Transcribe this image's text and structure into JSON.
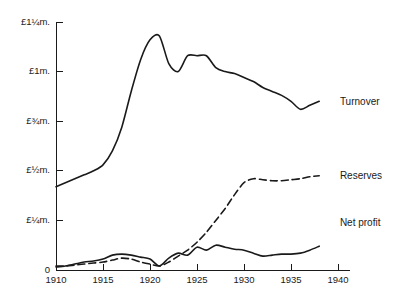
{
  "chart_data": {
    "type": "line",
    "title": "",
    "subtitle": "",
    "xlabel": "",
    "ylabel": "",
    "xlim": [
      1910,
      1940
    ],
    "ylim": [
      0,
      1.25
    ],
    "grid": false,
    "legend_position": "inline-right",
    "y_tick_values": [
      0,
      0.25,
      0.5,
      0.75,
      1.0,
      1.25
    ],
    "y_tick_labels": [
      "0",
      "£¼m.",
      "£½m.",
      "£¾m.",
      "£1m.",
      "£1¼m."
    ],
    "x_tick_values": [
      1910,
      1915,
      1920,
      1925,
      1930,
      1935,
      1940
    ],
    "x_tick_labels": [
      "1910",
      "1915",
      "1920",
      "1925",
      "1930",
      "1935",
      "1940"
    ],
    "units": "pounds sterling (millions)",
    "series": [
      {
        "name": "Turnover",
        "label": "Turnover",
        "style": "solid",
        "color": "#1a1a1a",
        "label_x": 1940.2,
        "label_y": 0.845,
        "x": [
          1910,
          1911,
          1912,
          1913,
          1914,
          1915,
          1916,
          1917,
          1918,
          1919,
          1920,
          1921,
          1922,
          1923,
          1924,
          1925,
          1926,
          1927,
          1928,
          1929,
          1930,
          1931,
          1932,
          1933,
          1934,
          1935,
          1936,
          1937,
          1938
        ],
        "y": [
          0.42,
          0.44,
          0.46,
          0.48,
          0.5,
          0.53,
          0.6,
          0.72,
          0.9,
          1.06,
          1.16,
          1.18,
          1.04,
          1.0,
          1.08,
          1.08,
          1.08,
          1.02,
          1.0,
          0.99,
          0.97,
          0.95,
          0.92,
          0.9,
          0.88,
          0.85,
          0.81,
          0.83,
          0.85
        ]
      },
      {
        "name": "Reserves",
        "label": "Reserves",
        "style": "dashed",
        "color": "#1a1a1a",
        "label_x": 1940.2,
        "label_y": 0.47,
        "x": [
          1910,
          1911,
          1912,
          1913,
          1914,
          1915,
          1916,
          1917,
          1918,
          1919,
          1920,
          1921,
          1922,
          1923,
          1924,
          1925,
          1926,
          1927,
          1928,
          1929,
          1930,
          1931,
          1932,
          1933,
          1934,
          1935,
          1936,
          1937,
          1938
        ],
        "y": [
          0.02,
          0.02,
          0.025,
          0.03,
          0.035,
          0.04,
          0.05,
          0.06,
          0.055,
          0.04,
          0.03,
          0.02,
          0.04,
          0.07,
          0.1,
          0.14,
          0.19,
          0.25,
          0.31,
          0.38,
          0.44,
          0.46,
          0.455,
          0.45,
          0.45,
          0.455,
          0.46,
          0.47,
          0.475
        ]
      },
      {
        "name": "Net profit",
        "label": "Net profit",
        "style": "solid",
        "color": "#1a1a1a",
        "label_x": 1940.2,
        "label_y": 0.235,
        "x": [
          1910,
          1911,
          1912,
          1913,
          1914,
          1915,
          1916,
          1917,
          1918,
          1919,
          1920,
          1921,
          1922,
          1923,
          1924,
          1925,
          1926,
          1927,
          1928,
          1929,
          1930,
          1931,
          1932,
          1933,
          1934,
          1935,
          1936,
          1937,
          1938
        ],
        "y": [
          0.015,
          0.02,
          0.03,
          0.04,
          0.045,
          0.055,
          0.075,
          0.08,
          0.075,
          0.065,
          0.055,
          0.02,
          0.06,
          0.085,
          0.075,
          0.115,
          0.1,
          0.125,
          0.115,
          0.105,
          0.1,
          0.085,
          0.07,
          0.075,
          0.08,
          0.08,
          0.085,
          0.1,
          0.12
        ]
      }
    ]
  },
  "labels": {
    "turnover": "Turnover",
    "reserves": "Reserves",
    "net_profit": "Net profit"
  }
}
